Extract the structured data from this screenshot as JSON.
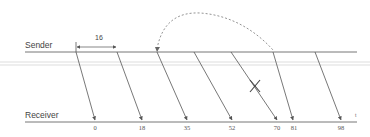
{
  "diagram": {
    "type": "sequence-timing",
    "sender_label": "Sender",
    "receiver_label": "Receiver",
    "interval_label": "16",
    "time_axis_label": "t",
    "colors": {
      "line": "#555555",
      "faint_line": "#cccccc",
      "dashed_arc": "#888888"
    },
    "messages": [
      {
        "label": "0",
        "lost": false
      },
      {
        "label": "18",
        "lost": false
      },
      {
        "label": "35",
        "lost": false
      },
      {
        "label": "52",
        "lost": false
      },
      {
        "label": "70",
        "lost": true
      },
      {
        "label": "81",
        "lost": false
      },
      {
        "label": "98",
        "lost": false
      }
    ],
    "lost_marker": "X",
    "retransmission": {
      "style": "dashed-arc",
      "from_message": 3,
      "to_message": 6
    }
  }
}
